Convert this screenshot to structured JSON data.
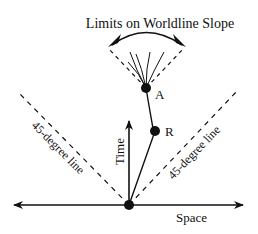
{
  "diagram": {
    "title": "Limits on Worldline Slope",
    "labels": {
      "time_axis": "Time",
      "space_axis": "Space",
      "left_line": "45-degree line",
      "right_line": "45-degree line",
      "event_a": "A",
      "event_r": "R"
    },
    "colors": {
      "ink": "#111111",
      "background": "#ffffff"
    }
  }
}
